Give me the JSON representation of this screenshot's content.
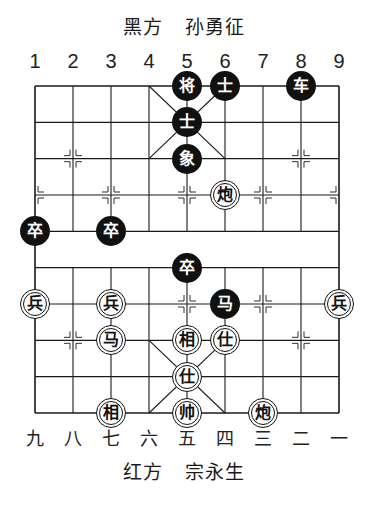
{
  "header": {
    "side_label": "黑方",
    "player_name": "孙勇征"
  },
  "footer": {
    "side_label": "红方",
    "player_name": "宗永生"
  },
  "column_numbers_top": [
    "1",
    "2",
    "3",
    "4",
    "5",
    "6",
    "7",
    "8",
    "9"
  ],
  "column_numbers_bottom": [
    "九",
    "八",
    "七",
    "六",
    "五",
    "四",
    "三",
    "二",
    "一"
  ],
  "board": {
    "files": 9,
    "ranks": 10,
    "line_color": "#1a1a1a",
    "black_piece_color": "#111111",
    "red_piece_color": "#ffffff"
  },
  "pieces": [
    {
      "side": "black",
      "char": "将",
      "col": 4,
      "row": 0
    },
    {
      "side": "black",
      "char": "士",
      "col": 5,
      "row": 0
    },
    {
      "side": "black",
      "char": "车",
      "col": 7,
      "row": 0
    },
    {
      "side": "black",
      "char": "士",
      "col": 4,
      "row": 1
    },
    {
      "side": "black",
      "char": "象",
      "col": 4,
      "row": 2
    },
    {
      "side": "red",
      "char": "炮",
      "col": 5,
      "row": 3
    },
    {
      "side": "black",
      "char": "卒",
      "col": 0,
      "row": 4
    },
    {
      "side": "black",
      "char": "卒",
      "col": 2,
      "row": 4
    },
    {
      "side": "black",
      "char": "卒",
      "col": 4,
      "row": 5
    },
    {
      "side": "red",
      "char": "兵",
      "col": 0,
      "row": 6
    },
    {
      "side": "red",
      "char": "兵",
      "col": 2,
      "row": 6
    },
    {
      "side": "black",
      "char": "马",
      "col": 5,
      "row": 6
    },
    {
      "side": "red",
      "char": "兵",
      "col": 8,
      "row": 6
    },
    {
      "side": "red",
      "char": "马",
      "col": 2,
      "row": 7
    },
    {
      "side": "red",
      "char": "相",
      "col": 4,
      "row": 7
    },
    {
      "side": "red",
      "char": "仕",
      "col": 5,
      "row": 7
    },
    {
      "side": "red",
      "char": "仕",
      "col": 4,
      "row": 8
    },
    {
      "side": "red",
      "char": "相",
      "col": 2,
      "row": 9
    },
    {
      "side": "red",
      "char": "帅",
      "col": 4,
      "row": 9
    },
    {
      "side": "red",
      "char": "炮",
      "col": 6,
      "row": 9
    }
  ]
}
